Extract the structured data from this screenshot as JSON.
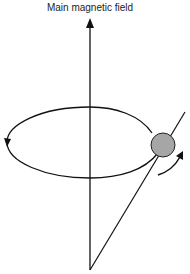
{
  "diagram": {
    "title": "Main magnetic field",
    "elements": {
      "field_axis": {
        "type": "arrow",
        "direction": "up",
        "label": "Main magnetic field"
      },
      "precession_orbit": {
        "type": "ellipse",
        "direction": "counterclockwise"
      },
      "spin_particle": {
        "type": "sphere",
        "color": "#a6a6a6"
      },
      "spin_axis": {
        "type": "line",
        "tilted": true
      },
      "rotation_arrow": {
        "type": "curved-arrow"
      }
    },
    "colors": {
      "stroke": "#111111",
      "particle_fill": "#a6a6a6"
    }
  }
}
